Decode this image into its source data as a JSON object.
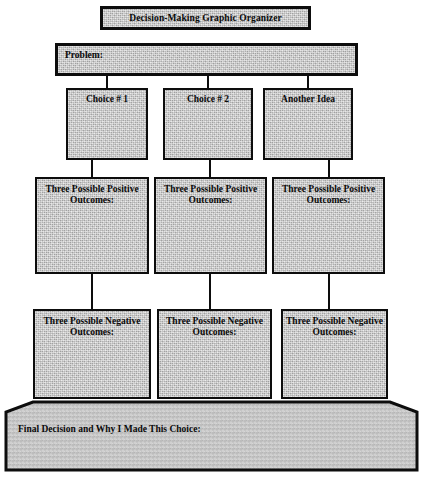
{
  "title": {
    "text": "Decision-Making Graphic Organizer"
  },
  "problem": {
    "label": "Problem:"
  },
  "choices": [
    {
      "label": "Choice # 1"
    },
    {
      "label": "Choice # 2"
    },
    {
      "label": "Another Idea"
    }
  ],
  "positive_outcomes": [
    {
      "label": "Three Possible Positive Outcomes:"
    },
    {
      "label": "Three Possible Positive Outcomes:"
    },
    {
      "label": "Three Possible Positive Outcomes:"
    }
  ],
  "negative_outcomes": [
    {
      "label": "Three Possible Negative Outcomes:"
    },
    {
      "label": "Three Possible Negative Outcomes:"
    },
    {
      "label": "Three Possible Negative Outcomes:"
    }
  ],
  "final_decision": {
    "label": "Final Decision and Why I Made This Choice:"
  },
  "colors": {
    "fill": "#c6c6c6",
    "border": "#0d0d0d",
    "text": "#0a0a0a",
    "page": "#ffffff"
  }
}
